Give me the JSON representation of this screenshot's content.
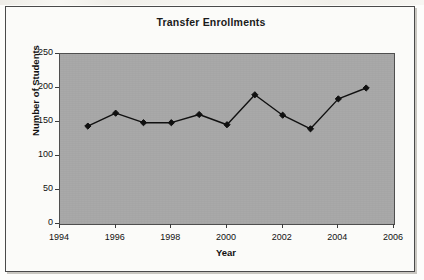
{
  "chart_data": {
    "type": "line",
    "title": "Transfer Enrollments",
    "xlabel": "Year",
    "ylabel": "Number of Students",
    "x": [
      1995,
      1996,
      1997,
      1998,
      1999,
      2000,
      2001,
      2002,
      2003,
      2004,
      2005
    ],
    "values": [
      144,
      163,
      149,
      149,
      161,
      146,
      190,
      160,
      140,
      184,
      200
    ],
    "series": [
      {
        "name": "Number of Students",
        "values": [
          144,
          163,
          149,
          149,
          161,
          146,
          190,
          160,
          140,
          184,
          200
        ]
      }
    ],
    "xlim": [
      1994,
      2006
    ],
    "ylim": [
      0,
      250
    ],
    "x_ticks": [
      1994,
      1996,
      1998,
      2000,
      2002,
      2004,
      2006
    ],
    "x_tick_labels": [
      "1994",
      "1996",
      "1998",
      "2000",
      "2002",
      "2004",
      "2006"
    ],
    "y_ticks": [
      0,
      50,
      100,
      150,
      200,
      250
    ],
    "y_tick_labels": [
      "0",
      "50",
      "100",
      "150",
      "200",
      "250"
    ],
    "grid": false,
    "legend": "none",
    "marker": "diamond",
    "line_color": "#111111",
    "marker_color": "#111111",
    "plot_bgcolor": "#a9a9a9",
    "figure_bgcolor": "#fbfbf9",
    "border_color": "#4a4a4a"
  }
}
